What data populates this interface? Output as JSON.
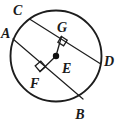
{
  "figure": {
    "background_color": "#ffffff",
    "stroke_color": "#1d1d1d",
    "label_color": "#1a1a1a",
    "circle": {
      "center_label": "E",
      "center_x": 56,
      "center_y": 56,
      "radius": 45.5,
      "stroke_width": 1.9
    },
    "center_dot": {
      "x": 56,
      "y": 56,
      "radius": 3.2
    },
    "chords": [
      {
        "name": "chord-CD",
        "from_label": "C",
        "to_label": "D",
        "x1": 29.5,
        "y1": 19.0,
        "x2": 100.0,
        "y2": 63.5,
        "stroke_width": 1.2
      },
      {
        "name": "chord-AB",
        "from_label": "A",
        "to_label": "B",
        "x1": 13.0,
        "y1": 39.0,
        "x2": 83.0,
        "y2": 99.0,
        "stroke_width": 1.2
      }
    ],
    "perpendicular_segments": [
      {
        "name": "segment-EG",
        "from_label": "E",
        "to_label": "G",
        "x1": 56,
        "y1": 56,
        "x2": 61.5,
        "y2": 36.5,
        "stroke_width": 1.3
      },
      {
        "name": "segment-EF",
        "from_label": "E",
        "to_label": "F",
        "x1": 56,
        "y1": 56,
        "x2": 40.0,
        "y2": 71.5,
        "stroke_width": 1.3
      }
    ],
    "right_angle_marks": [
      {
        "name": "right-angle-at-G",
        "points": "61.5,36.5 67.2,40.1 63.6,45.8 57.9,42.2",
        "stroke_width": 1.3
      },
      {
        "name": "right-angle-at-F",
        "points": "40.0,71.5 35.2,65.9 40.8,61.1 45.6,66.7",
        "stroke_width": 1.3
      }
    ],
    "labels": [
      {
        "id": "A",
        "text": "A",
        "x": 1.0,
        "y": 38.0,
        "anchor": "start",
        "font_size": 14
      },
      {
        "id": "B",
        "text": "B",
        "x": 80.0,
        "y": 118.5,
        "anchor": "middle",
        "font_size": 14
      },
      {
        "id": "C",
        "text": "C",
        "x": 13.0,
        "y": 15.0,
        "anchor": "start",
        "font_size": 14
      },
      {
        "id": "D",
        "text": "D",
        "x": 104.0,
        "y": 66.0,
        "anchor": "start",
        "font_size": 14
      },
      {
        "id": "E",
        "text": "E",
        "x": 62.0,
        "y": 72.5,
        "anchor": "start",
        "font_size": 14
      },
      {
        "id": "F",
        "text": "F",
        "x": 30.0,
        "y": 88.0,
        "anchor": "start",
        "font_size": 14
      },
      {
        "id": "G",
        "text": "G",
        "x": 57.0,
        "y": 32.0,
        "anchor": "start",
        "font_size": 14
      }
    ]
  },
  "chart_data": {
    "type": "diagram",
    "shapes": [
      {
        "kind": "circle",
        "center": "E",
        "center_px": [
          56,
          56
        ],
        "radius_px": 45.5
      },
      {
        "kind": "chord",
        "endpoints": [
          "C",
          "D"
        ],
        "from_px": [
          29.5,
          19.0
        ],
        "to_px": [
          100.0,
          63.5
        ]
      },
      {
        "kind": "chord",
        "endpoints": [
          "A",
          "B"
        ],
        "from_px": [
          13.0,
          39.0
        ],
        "to_px": [
          83.0,
          99.0
        ]
      },
      {
        "kind": "segment",
        "endpoints": [
          "E",
          "G"
        ],
        "from_px": [
          56,
          56
        ],
        "to_px": [
          61.5,
          36.5
        ],
        "perpendicular_to": "chord CD"
      },
      {
        "kind": "segment",
        "endpoints": [
          "E",
          "F"
        ],
        "from_px": [
          56,
          56
        ],
        "to_px": [
          40.0,
          71.5
        ],
        "perpendicular_to": "chord AB"
      }
    ],
    "points": [
      {
        "label": "A",
        "on": "circle",
        "px": [
          13.0,
          39.0
        ]
      },
      {
        "label": "B",
        "on": "circle",
        "px": [
          83.0,
          99.0
        ]
      },
      {
        "label": "C",
        "on": "circle",
        "px": [
          29.5,
          19.0
        ]
      },
      {
        "label": "D",
        "on": "circle",
        "px": [
          100.0,
          63.5
        ]
      },
      {
        "label": "E",
        "on": "center",
        "px": [
          56,
          56
        ]
      },
      {
        "label": "F",
        "on": "chord AB",
        "px": [
          40.0,
          71.5
        ]
      },
      {
        "label": "G",
        "on": "chord CD",
        "px": [
          61.5,
          36.5
        ]
      }
    ],
    "right_angles": [
      {
        "at": "G",
        "between": [
          "EG",
          "CD"
        ]
      },
      {
        "at": "F",
        "between": [
          "EF",
          "AB"
        ]
      }
    ],
    "annotations": [
      "A",
      "B",
      "C",
      "D",
      "E",
      "F",
      "G"
    ]
  }
}
